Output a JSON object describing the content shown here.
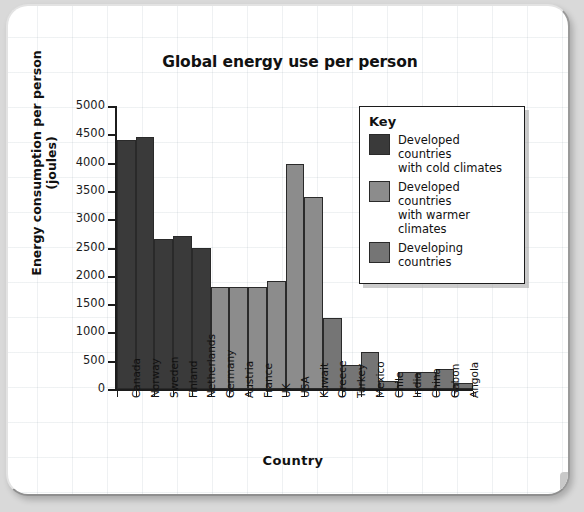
{
  "chart_data": {
    "type": "bar",
    "title": "Global energy use per person",
    "xlabel": "Country",
    "ylabel": "Energy consumption per person (joules)",
    "ylim": [
      0,
      5000
    ],
    "ytick_step": 500,
    "yticks": [
      "0",
      "500",
      "1000",
      "1500",
      "2000",
      "2500",
      "3000",
      "3500",
      "4000",
      "4500",
      "5000"
    ],
    "grid": true,
    "legend_position": "top-right",
    "categories": [
      "Canada",
      "Norway",
      "Sweden",
      "Finland",
      "Netherlands",
      "Germany",
      "Austria",
      "France",
      "UK",
      "USA",
      "Kuwait",
      "Greece",
      "Turkey",
      "Mexico",
      "Chile",
      "India",
      "China",
      "Gabon",
      "Angola"
    ],
    "values": [
      4400,
      4450,
      2650,
      2700,
      2500,
      1800,
      1800,
      1800,
      1900,
      3980,
      3400,
      1250,
      430,
      650,
      150,
      300,
      300,
      350,
      100
    ],
    "groups": [
      "cold",
      "cold",
      "cold",
      "cold",
      "cold",
      "warm",
      "warm",
      "warm",
      "warm",
      "warm",
      "warm",
      "developing",
      "developing",
      "developing",
      "developing",
      "developing",
      "developing",
      "developing",
      "developing"
    ],
    "series": [
      {
        "name": "Developed countries with cold climates",
        "color": "#3a3a3a"
      },
      {
        "name": "Developed countries with warmer climates",
        "color": "#8c8c8c"
      },
      {
        "name": "Developing countries",
        "color": "#757575"
      }
    ]
  },
  "legend": {
    "title": "Key",
    "entries": [
      {
        "label_line1": "Developed countries",
        "label_line2": "with cold climates",
        "color": "#3a3a3a"
      },
      {
        "label_line1": "Developed countries",
        "label_line2": "with warmer climates",
        "color": "#8c8c8c"
      },
      {
        "label_line1": "Developing countries",
        "label_line2": "",
        "color": "#757575"
      }
    ]
  }
}
